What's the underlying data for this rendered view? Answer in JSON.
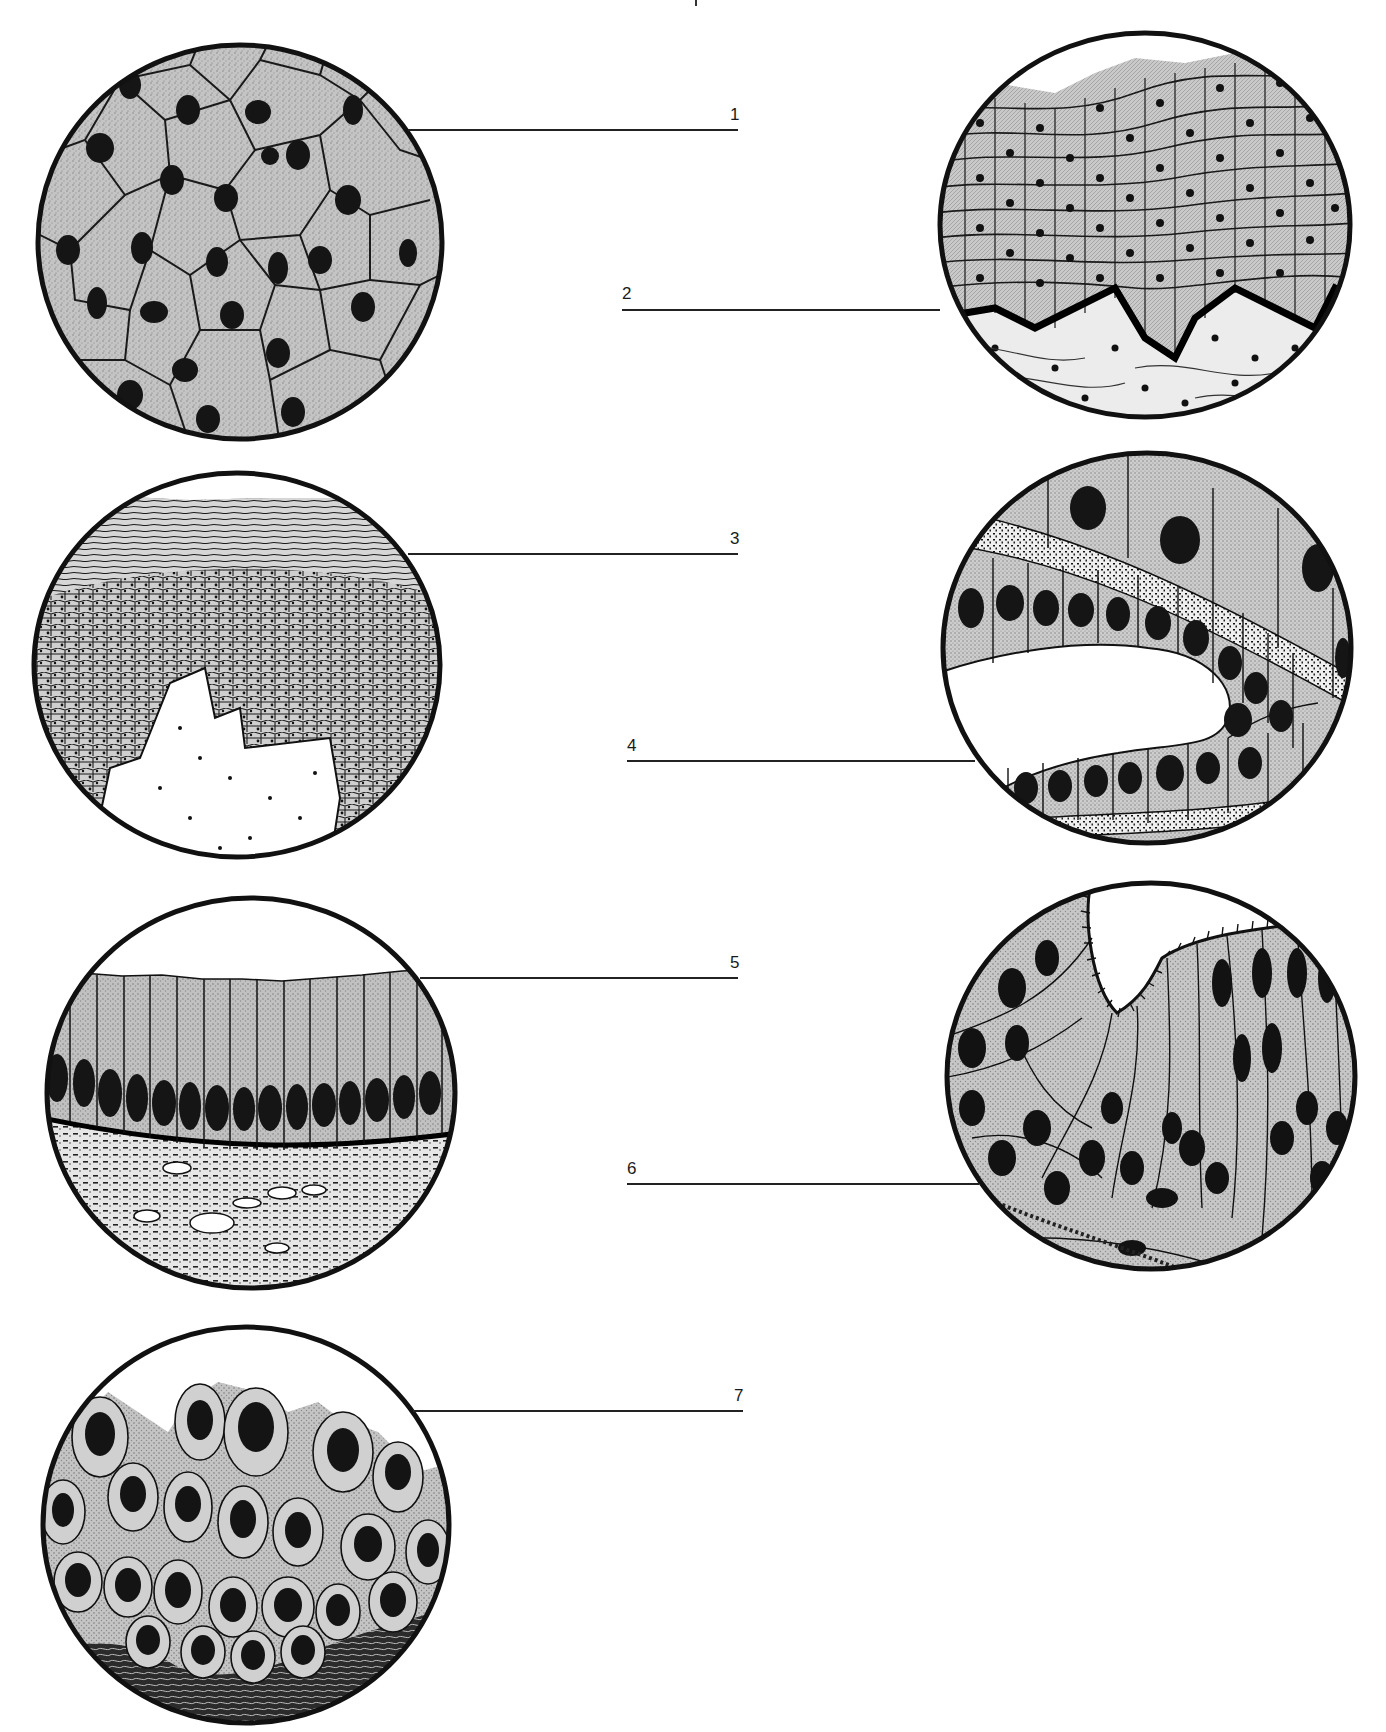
{
  "figure": {
    "type": "histology-labeling-worksheet",
    "colors": {
      "outline": "#111111",
      "cytoplasm": "#bdbdbd",
      "nucleus": "#1a1a1a",
      "background": "#ffffff",
      "connective": "#e4e4e4"
    },
    "labels": [
      {
        "number": "1",
        "tissue_drawing": "simple squamous epithelium (surface view, polygonal cells with central nuclei)"
      },
      {
        "number": "2",
        "tissue_drawing": "stratified squamous epithelium over connective tissue"
      },
      {
        "number": "3",
        "tissue_drawing": "stratified squamous keratinized epithelium with papilla"
      },
      {
        "number": "4",
        "tissue_drawing": "simple cuboidal epithelium lining a duct/tubule"
      },
      {
        "number": "5",
        "tissue_drawing": "simple columnar epithelium on connective tissue"
      },
      {
        "number": "6",
        "tissue_drawing": "pseudostratified ciliated columnar epithelium"
      },
      {
        "number": "7",
        "tissue_drawing": "transitional epithelium"
      }
    ]
  }
}
